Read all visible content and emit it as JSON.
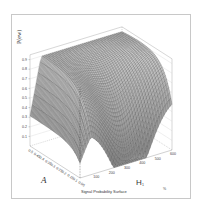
{
  "chart_data": {
    "type": "surface3d",
    "title": "Signal Probability Surface",
    "zlabel": "P(ew)",
    "xlabel": "A",
    "ylabel": "H1",
    "z_ticks": [
      "0.1",
      "0.2",
      "0.3",
      "0.4",
      "0.5",
      "0.6",
      "0.7",
      "0.8",
      "0.9"
    ],
    "x_ticks": [
      "0.5",
      "0.45",
      "0.4",
      "0.35",
      "0.3",
      "0.25",
      "0.2",
      "0.15",
      "0.1",
      "0.05"
    ],
    "y_ticks": [
      "100",
      "200",
      "300",
      "400",
      "500",
      "600"
    ],
    "zlim": [
      0,
      0.9
    ],
    "xlim": [
      0.05,
      0.5
    ],
    "ylim": [
      0,
      600
    ],
    "grid": false,
    "colormap": "grayscale-mesh",
    "corner_mark": "%"
  },
  "labels": {
    "zlabel": "P(ew)",
    "xlabel": "A",
    "ylabel": "H",
    "ylabel_sub": "1",
    "caption": "Signal Probability Surface",
    "corner_mark": "%"
  }
}
